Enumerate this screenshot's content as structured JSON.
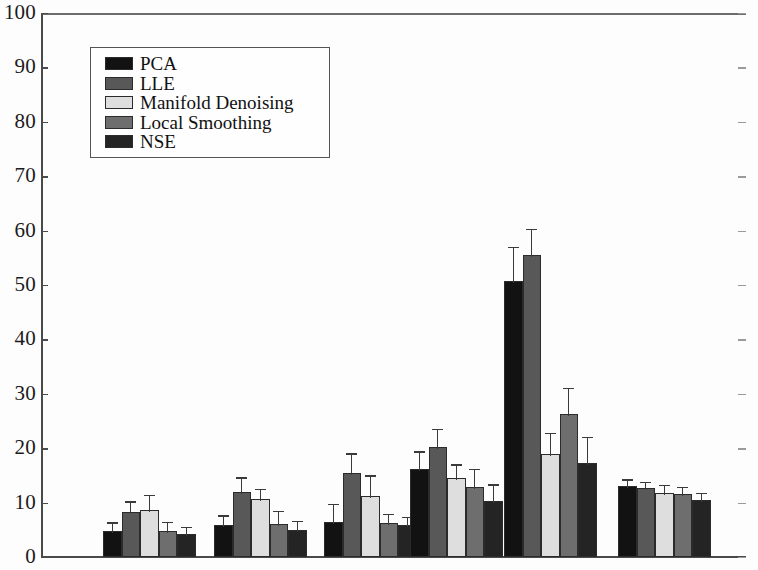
{
  "chart_data": {
    "type": "bar",
    "title": "",
    "xlabel": "",
    "ylabel": "",
    "ylim": [
      0,
      100
    ],
    "ytick_step": 10,
    "yticks": [
      0,
      10,
      20,
      30,
      40,
      50,
      60,
      70,
      80,
      90,
      100
    ],
    "grid": false,
    "legend_position": "upper-left",
    "categories": [
      "1",
      "2",
      "3",
      "4",
      "5",
      "6"
    ],
    "series": [
      {
        "name": "PCA",
        "color": "#121212",
        "values": [
          4.8,
          5.8,
          6.4,
          16.2,
          50.8,
          13.0
        ],
        "errors": [
          1.3,
          1.6,
          3.1,
          3.0,
          6.0,
          1.0
        ]
      },
      {
        "name": "LLE",
        "color": "#585858",
        "values": [
          8.2,
          12.0,
          15.5,
          20.3,
          55.5,
          12.6
        ],
        "errors": [
          1.8,
          2.4,
          3.3,
          3.0,
          4.6,
          1.0
        ]
      },
      {
        "name": "Manifold Denoising",
        "color": "#dedede",
        "values": [
          8.6,
          10.7,
          11.3,
          14.5,
          19.0,
          11.8
        ],
        "errors": [
          2.6,
          1.6,
          3.5,
          2.3,
          3.6,
          1.2
        ]
      },
      {
        "name": "Local Smoothing",
        "color": "#6e6e6e",
        "values": [
          4.7,
          6.0,
          6.3,
          12.8,
          26.2,
          11.6
        ],
        "errors": [
          1.5,
          2.2,
          1.4,
          3.2,
          4.6,
          1.1
        ]
      },
      {
        "name": "NSE",
        "color": "#242424",
        "values": [
          4.2,
          5.0,
          5.8,
          10.3,
          17.3,
          10.5
        ],
        "errors": [
          1.1,
          1.4,
          1.3,
          2.8,
          4.5,
          1.0
        ]
      }
    ]
  },
  "legend": {
    "entries": [
      {
        "label": "PCA",
        "color": "#121212"
      },
      {
        "label": "LLE",
        "color": "#585858"
      },
      {
        "label": "Manifold Denoising",
        "color": "#dedede"
      },
      {
        "label": "Local Smoothing",
        "color": "#6e6e6e"
      },
      {
        "label": "NSE",
        "color": "#242424"
      }
    ]
  },
  "axis": {
    "y_labels": [
      "100",
      "90",
      "80",
      "70",
      "60",
      "50",
      "40",
      "30",
      "20",
      "10",
      "0"
    ]
  }
}
